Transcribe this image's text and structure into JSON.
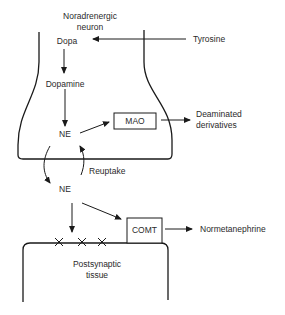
{
  "diagram": {
    "neuron_label": [
      "Noradrenergic",
      "neuron"
    ],
    "nodes": {
      "dopa": "Dopa",
      "tyrosine": "Tyrosine",
      "dopamine": "Dopamine",
      "ne_intracellular": "NE",
      "mao": "MAO",
      "deaminated": [
        "Deaminated",
        "derivatives"
      ],
      "reuptake": "Reuptake",
      "ne_synaptic": "NE",
      "comt": "COMT",
      "normetanephrine": "Normetanephrine",
      "postsynaptic": [
        "Postsynaptic",
        "tissue"
      ]
    },
    "receptor_marks": 3,
    "edges": [
      {
        "from": "Tyrosine",
        "to": "Dopa"
      },
      {
        "from": "Dopa",
        "to": "Dopamine"
      },
      {
        "from": "Dopamine",
        "to": "NE"
      },
      {
        "from": "NE",
        "to": "MAO"
      },
      {
        "from": "MAO",
        "to": "Deaminated derivatives"
      },
      {
        "from": "NE (intracellular)",
        "to": "NE (synaptic)",
        "label": "release"
      },
      {
        "from": "NE (synaptic)",
        "to": "NE (intracellular)",
        "label": "Reuptake"
      },
      {
        "from": "NE (synaptic)",
        "to": "Postsynaptic receptors"
      },
      {
        "from": "NE (synaptic)",
        "to": "COMT"
      },
      {
        "from": "COMT",
        "to": "Normetanephrine"
      }
    ],
    "colors": {
      "line": "#1a1a1a",
      "text": "#2a2a2a",
      "background": "#ffffff"
    }
  }
}
